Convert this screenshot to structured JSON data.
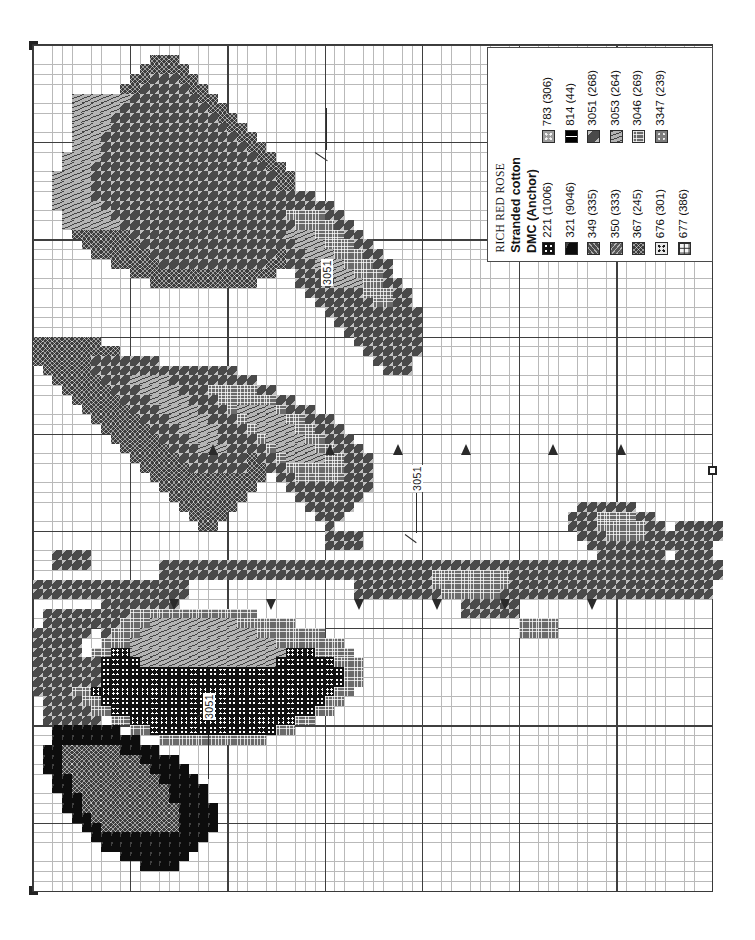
{
  "document": {
    "type": "cross-stitch-pattern-chart",
    "title": "RICH RED ROSE"
  },
  "legend": {
    "title": "RICH RED ROSE",
    "subtitle_line1": "Stranded cotton",
    "subtitle_line2": "DMC (Anchor)",
    "columns": [
      {
        "name": "left-column",
        "entries": [
          {
            "dmc": "221",
            "anchor": "(1006)",
            "label": "221  (1006)",
            "symbol": "dots-four-on-black",
            "swatch_class": "f221",
            "color": "#111111"
          },
          {
            "dmc": "321",
            "anchor": "(9046)",
            "label": "321  (9046)",
            "symbol": "solid-black",
            "swatch_class": "f321",
            "color": "#0d0d0d"
          },
          {
            "dmc": "349",
            "anchor": "(335)",
            "label": "349  (335)",
            "symbol": "diagonal-hatch-right",
            "swatch_class": "f349",
            "color": "#4c4c4c"
          },
          {
            "dmc": "350",
            "anchor": "(333)",
            "label": "350  (333)",
            "symbol": "diagonal-hatch-left",
            "swatch_class": "f350",
            "color": "#595959"
          },
          {
            "dmc": "367",
            "anchor": "(245)",
            "label": "367  (245)",
            "symbol": "cross-hatch-x",
            "swatch_class": "f367",
            "color": "#3d3d3d"
          },
          {
            "dmc": "676",
            "anchor": "(301)",
            "label": "676  (301)",
            "symbol": "four-dark-dots-on-light",
            "swatch_class": "f676",
            "color": "#e9e9e9"
          },
          {
            "dmc": "677",
            "anchor": "(386)",
            "label": "677  (386)",
            "symbol": "corner-L-marks",
            "swatch_class": "f677",
            "color": "#f4f4f4"
          }
        ]
      },
      {
        "name": "right-column",
        "entries": [
          {
            "dmc": "783",
            "anchor": "(306)",
            "label": "783   (306)",
            "symbol": "light-dots-on-gray",
            "swatch_class": "f783",
            "color": "#9d9d9d"
          },
          {
            "dmc": "814",
            "anchor": "(44)",
            "label": "814   (44)",
            "symbol": "white-blocks-on-black",
            "swatch_class": "f814",
            "color": "#000000"
          },
          {
            "dmc": "3051",
            "anchor": "(268)",
            "label": "3051 (268)",
            "symbol": "triangle-arrows",
            "swatch_class": "f3051",
            "color": "#4a4a4a"
          },
          {
            "dmc": "3053",
            "anchor": "(264)",
            "label": "3053 (264)",
            "symbol": "v-marks-light",
            "swatch_class": "f3053",
            "color": "#b4b4b4"
          },
          {
            "dmc": "3046",
            "anchor": "(269)",
            "label": "3046 (269)",
            "symbol": "grid-squares",
            "swatch_class": "f3046",
            "color": "#6b6b6b"
          },
          {
            "dmc": "3347",
            "anchor": "(239)",
            "label": "3347 (239)",
            "symbol": "open-circles-on-gray",
            "swatch_class": "f3347",
            "color": "#7d7d7d"
          }
        ]
      }
    ]
  },
  "annotations": [
    {
      "text": "3051",
      "id": "leader-3051-upper"
    },
    {
      "text": "3051",
      "id": "leader-3051-middle"
    },
    {
      "text": "3051",
      "id": "leader-3051-lower"
    }
  ],
  "chart": {
    "grid": {
      "cell_px": 9.72,
      "major_every": 10,
      "minor_color": "#b9b9b9",
      "major_color": "#3f3f3f",
      "border_color": "#3a3a3a"
    },
    "center_markers": [
      "top-left",
      "bottom-left",
      "right-middle"
    ]
  },
  "chart_data": {
    "type": "heatmap",
    "title": "RICH RED ROSE",
    "xlabel": "",
    "ylabel": "",
    "grid": true,
    "legend_position": "top-right",
    "categories": [
      "221",
      "321",
      "349",
      "350",
      "367",
      "676",
      "677",
      "783",
      "814",
      "3051",
      "3053",
      "3046",
      "3347"
    ],
    "regions": [
      {
        "name": "upper-left-petal-outer",
        "thread": "3053",
        "x": 2,
        "y": 4,
        "w": 7,
        "h": 18
      },
      {
        "name": "upper-left-petal-mid",
        "thread": "3051",
        "x": 5,
        "y": 2,
        "w": 9,
        "h": 22
      },
      {
        "name": "upper-left-petal-core",
        "thread": "367",
        "x": 10,
        "y": 1,
        "w": 12,
        "h": 26
      },
      {
        "name": "left-leaf-upper",
        "thread": "3051",
        "x": 0,
        "y": 18,
        "w": 16,
        "h": 14
      },
      {
        "name": "center-leaf-left",
        "thread": "367",
        "x": 4,
        "y": 30,
        "w": 18,
        "h": 26
      },
      {
        "name": "center-leaf-highlight",
        "thread": "3053",
        "x": 14,
        "y": 28,
        "w": 12,
        "h": 16
      },
      {
        "name": "center-leaf-right",
        "thread": "3051",
        "x": 20,
        "y": 12,
        "w": 20,
        "h": 30
      },
      {
        "name": "right-leaf-blade",
        "thread": "3046",
        "x": 24,
        "y": 22,
        "w": 16,
        "h": 22
      },
      {
        "name": "main-stem",
        "thread": "3051",
        "x": 32,
        "y": 52,
        "w": 38,
        "h": 3
      },
      {
        "name": "lower-leaf-left",
        "thread": "367",
        "x": 2,
        "y": 56,
        "w": 14,
        "h": 22
      },
      {
        "name": "lower-leaf-body",
        "thread": "3046",
        "x": 9,
        "y": 56,
        "w": 20,
        "h": 12
      },
      {
        "name": "lower-leaf-core",
        "thread": "221",
        "x": 10,
        "y": 62,
        "w": 18,
        "h": 12
      },
      {
        "name": "bottom-petal",
        "thread": "321",
        "x": 2,
        "y": 72,
        "w": 16,
        "h": 16
      },
      {
        "name": "right-bud",
        "thread": "3051",
        "x": 56,
        "y": 48,
        "w": 14,
        "h": 8
      }
    ],
    "thorn_count": 8,
    "note": "Grayscale symbol-filled counted cross-stitch chart; each grid cell equals one stitch."
  }
}
